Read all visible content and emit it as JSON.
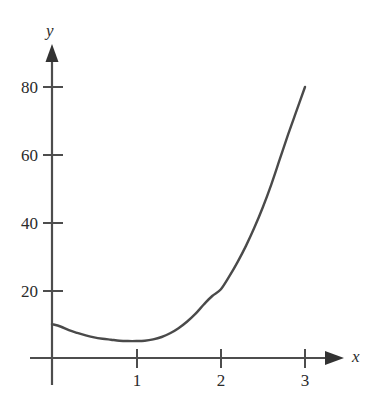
{
  "chart_data": {
    "type": "line",
    "title": "",
    "subtitle": "",
    "xlabel": "x",
    "ylabel": "y",
    "xlim": [
      0,
      3.15
    ],
    "ylim": [
      0,
      88
    ],
    "grid": false,
    "legend": null,
    "annotations": [],
    "x_ticks": [
      {
        "value": 1,
        "label": "1"
      },
      {
        "value": 2,
        "label": "2"
      },
      {
        "value": 3,
        "label": "3"
      }
    ],
    "y_ticks": [
      {
        "value": 20,
        "label": "20"
      },
      {
        "value": 40,
        "label": "40"
      },
      {
        "value": 60,
        "label": "60"
      },
      {
        "value": 80,
        "label": "80"
      }
    ],
    "series": [
      {
        "name": "curve",
        "color": "#4a4a4a",
        "line_width": 2.4,
        "x": [
          0.0,
          0.1,
          0.2,
          0.3,
          0.4,
          0.5,
          0.6,
          0.7,
          0.8,
          0.9,
          1.0,
          1.1,
          1.2,
          1.3,
          1.4,
          1.5,
          1.6,
          1.7,
          1.8,
          1.9,
          2.0,
          2.1,
          2.2,
          2.3,
          2.4,
          2.5,
          2.6,
          2.7,
          2.8,
          2.9,
          3.0
        ],
        "y": [
          10.0,
          9.3,
          8.2,
          7.4,
          6.7,
          6.1,
          5.7,
          5.4,
          5.1,
          5.0,
          5.0,
          5.1,
          5.5,
          6.2,
          7.3,
          8.8,
          10.7,
          13.0,
          15.8,
          18.3,
          20.2,
          24.0,
          28.3,
          33.1,
          38.5,
          44.5,
          51.2,
          58.6,
          66.0,
          73.0,
          80.0
        ]
      }
    ]
  },
  "axes": {
    "y_axis_label": "y",
    "x_axis_label": "x"
  },
  "colors": {
    "curve": "#4a4a4a",
    "axis": "#4d4d4d",
    "text": "#2b2b2b",
    "background": "#ffffff"
  }
}
